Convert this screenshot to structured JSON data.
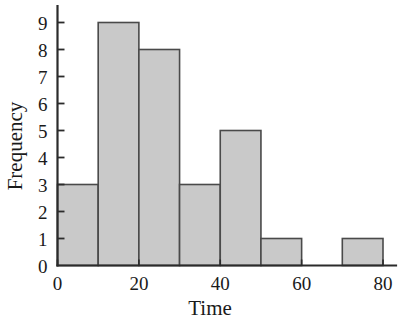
{
  "chart_data": {
    "type": "bar",
    "title": "",
    "subtitle": "",
    "xlabel": "Time",
    "ylabel": "Frequency",
    "bin_width": 10,
    "bin_edges": [
      0,
      10,
      20,
      30,
      40,
      50,
      60,
      70,
      80
    ],
    "categories": [
      "0-10",
      "10-20",
      "20-30",
      "30-40",
      "40-50",
      "50-60",
      "60-70",
      "70-80"
    ],
    "values": [
      3,
      9,
      8,
      3,
      5,
      1,
      0,
      1
    ],
    "xlim": [
      0,
      80
    ],
    "ylim": [
      0,
      9
    ],
    "x_ticks": [
      0,
      20,
      40,
      60,
      80
    ],
    "x_tick_labels": [
      "0",
      "20",
      "40",
      "60",
      "80"
    ],
    "y_ticks": [
      0,
      1,
      2,
      3,
      4,
      5,
      6,
      7,
      8,
      9
    ],
    "y_tick_labels": [
      "0",
      "1",
      "2",
      "3",
      "4",
      "5",
      "6",
      "7",
      "8",
      "9"
    ],
    "grid": false,
    "legend": false,
    "legend_position": "none",
    "bar_fill_color": "#c9c9c9",
    "bar_edge_color": "#4a4a4a",
    "axis_color": "#2b2b2b",
    "background_color": "#ffffff"
  }
}
